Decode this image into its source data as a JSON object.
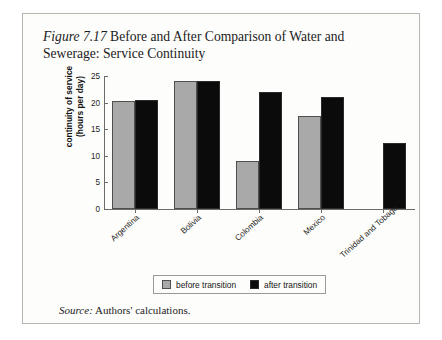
{
  "figure": {
    "number": "Figure 7.17",
    "title_rest": " Before and After Comparison of Water and Sewerage: Service Continuity",
    "source_label": "Source:",
    "source_text": " Authors' calculations."
  },
  "legend": {
    "before_label": "before transition",
    "after_label": "after transition"
  },
  "colors": {
    "before": "#a9a9a9",
    "after": "#0b0b0b",
    "frame": "#b7b5b0",
    "axis": "#6c6c6c",
    "page_background": "#fdfdfb"
  },
  "chart_data": {
    "type": "bar",
    "title": "Figure 7.17 Before and After Comparison of Water and Sewerage: Service Continuity",
    "xlabel": "",
    "ylabel": "continuity of service (hours per day)",
    "ylabel_line1": "continuity of service",
    "ylabel_line2": "(hours per day)",
    "categories": [
      "Argentina",
      "Bolivia",
      "Colombia",
      "Mexico",
      "Trinidad and Tobago"
    ],
    "series": [
      {
        "name": "before transition",
        "color": "#a9a9a9",
        "values": [
          20.3,
          24.0,
          9.1,
          17.5,
          null
        ]
      },
      {
        "name": "after transition",
        "color": "#0b0b0b",
        "values": [
          20.5,
          24.0,
          22.0,
          21.0,
          12.5
        ]
      }
    ],
    "ylim": [
      0,
      25
    ],
    "yticks": [
      0,
      5,
      10,
      15,
      20,
      25
    ],
    "ytick_labels": [
      "0",
      "5",
      "10",
      "15",
      "20",
      "25"
    ],
    "grid": false,
    "legend_position": "bottom"
  }
}
